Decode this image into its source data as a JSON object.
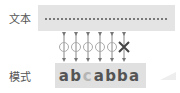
{
  "labels": {
    "text": "文本",
    "pattern": "模式"
  },
  "pattern": {
    "chars": [
      {
        "char": "a",
        "state": "match"
      },
      {
        "char": "b",
        "state": "match"
      },
      {
        "char": "c",
        "state": "dim"
      },
      {
        "char": "a",
        "state": "match"
      },
      {
        "char": "b",
        "state": "match"
      },
      {
        "char": "b",
        "state": "match"
      },
      {
        "char": "a",
        "state": "match"
      }
    ]
  },
  "comparisons": [
    "match",
    "match",
    "match",
    "match",
    "match",
    "mismatch"
  ],
  "colors": {
    "box": "#e4e4e4",
    "text": "#555555",
    "dim": "#b5b5b5",
    "link": "#777777"
  }
}
